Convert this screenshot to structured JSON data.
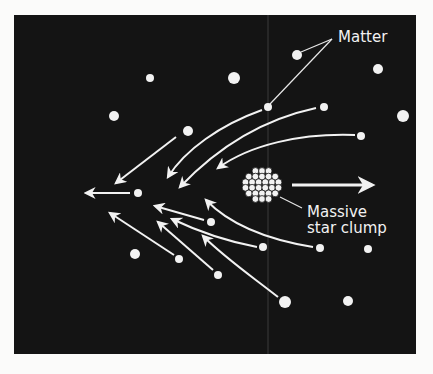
{
  "figure": {
    "labels": {
      "matter": "Matter",
      "clump_line1": "Massive",
      "clump_line2": "star clump"
    },
    "colors": {
      "background": "#141414",
      "foreground": "#f2f2f2",
      "page": "#fbfbfa"
    },
    "dots": [
      {
        "x": 297,
        "y": 55,
        "r": 5
      },
      {
        "x": 150,
        "y": 78,
        "r": 4
      },
      {
        "x": 234,
        "y": 78,
        "r": 6
      },
      {
        "x": 378,
        "y": 69,
        "r": 5
      },
      {
        "x": 114,
        "y": 116,
        "r": 5
      },
      {
        "x": 268,
        "y": 107,
        "r": 4
      },
      {
        "x": 324,
        "y": 107,
        "r": 4
      },
      {
        "x": 403,
        "y": 116,
        "r": 6
      },
      {
        "x": 188,
        "y": 131,
        "r": 5
      },
      {
        "x": 361,
        "y": 136,
        "r": 4
      },
      {
        "x": 138,
        "y": 193,
        "r": 4
      },
      {
        "x": 211,
        "y": 222,
        "r": 4
      },
      {
        "x": 263,
        "y": 247,
        "r": 4
      },
      {
        "x": 320,
        "y": 248,
        "r": 4
      },
      {
        "x": 368,
        "y": 249,
        "r": 4
      },
      {
        "x": 135,
        "y": 254,
        "r": 5
      },
      {
        "x": 179,
        "y": 259,
        "r": 4
      },
      {
        "x": 218,
        "y": 275,
        "r": 4
      },
      {
        "x": 285,
        "y": 302,
        "r": 6
      },
      {
        "x": 348,
        "y": 301,
        "r": 5
      }
    ],
    "clump_center": {
      "x": 262,
      "y": 185
    }
  }
}
